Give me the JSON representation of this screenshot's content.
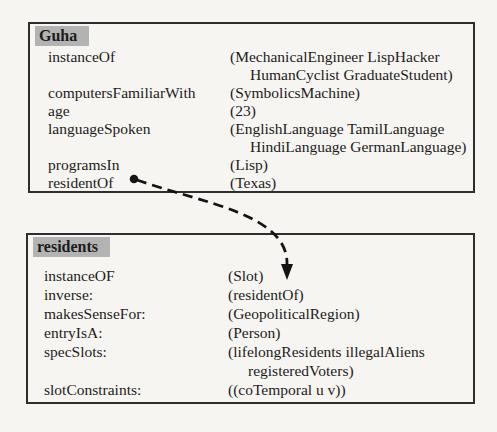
{
  "colors": {
    "page_bg": "#f7f5f1",
    "text": "#1c1c1c",
    "border": "#2e2e2e",
    "header_bg": "#b3b3b3",
    "arrow": "#141414"
  },
  "frames": [
    {
      "title": "Guha",
      "rows": [
        {
          "slot": "instanceOf",
          "value_lines": [
            "(MechanicalEngineer LispHacker",
            "HumanCyclist GraduateStudent)"
          ]
        },
        {
          "slot": "computersFamiliarWith",
          "value_lines": [
            "(SymbolicsMachine)"
          ]
        },
        {
          "slot": "age",
          "value_lines": [
            "(23)"
          ]
        },
        {
          "slot": "languageSpoken",
          "value_lines": [
            "(EnglishLanguage TamilLanguage",
            "HindiLanguage GermanLanguage)"
          ]
        },
        {
          "slot": "programsIn",
          "value_lines": [
            "(Lisp)"
          ]
        },
        {
          "slot": "residentOf",
          "value_lines": [
            "(Texas)"
          ]
        }
      ]
    },
    {
      "title": "residents",
      "rows": [
        {
          "slot": "instanceOF",
          "value_lines": [
            "(Slot)"
          ]
        },
        {
          "slot": "inverse:",
          "value_lines": [
            "(residentOf)"
          ]
        },
        {
          "slot": "makesSenseFor:",
          "value_lines": [
            "(GeopoliticalRegion)"
          ]
        },
        {
          "slot": "entryIsA:",
          "value_lines": [
            "(Person)"
          ]
        },
        {
          "slot": "specSlots:",
          "value_lines": [
            "(lifelongResidents illegalAliens",
            "registeredVoters)"
          ]
        },
        {
          "slot": "slotConstraints:",
          "value_lines": [
            "((coTemporal u v))"
          ]
        }
      ]
    }
  ],
  "connector": {
    "from": "Guha.residentOf",
    "to": "residents",
    "style": "dashed-curved-arrow"
  }
}
